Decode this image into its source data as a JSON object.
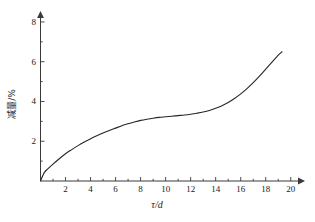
{
  "chart_data": {
    "type": "line",
    "title": "",
    "subtitle": "",
    "xlabel": "τ/d",
    "ylabel": "减量/%",
    "xlim": [
      0,
      21
    ],
    "ylim": [
      0,
      8.4
    ],
    "x_ticks": [
      2,
      4,
      6,
      8,
      10,
      12,
      14,
      16,
      18,
      20
    ],
    "x_tick_labels": [
      "2",
      "4",
      "6",
      "8",
      "10",
      "12",
      "14",
      "16",
      "18",
      "20"
    ],
    "x_minor_ticks": [
      1,
      3,
      5,
      7,
      9,
      11,
      13,
      15,
      17,
      19
    ],
    "y_ticks": [
      2,
      4,
      6,
      8
    ],
    "y_tick_labels": [
      "2",
      "4",
      "6",
      "8"
    ],
    "y_minor_ticks": [
      1,
      3,
      5,
      7
    ],
    "grid": false,
    "legend": null,
    "legend_position": "none",
    "axis_arrows": true,
    "series": [
      {
        "name": "减量",
        "color": "#262626",
        "line_width": 1.1,
        "x": [
          0.0,
          0.3,
          0.6,
          1.0,
          1.5,
          2.0,
          2.5,
          3.0,
          3.5,
          4.0,
          4.5,
          5.0,
          5.5,
          6.0,
          6.5,
          7.0,
          7.5,
          8.0,
          8.5,
          9.0,
          9.5,
          10.0,
          10.5,
          11.0,
          11.5,
          12.0,
          12.5,
          13.0,
          13.5,
          14.0,
          14.5,
          15.0,
          15.5,
          16.0,
          16.5,
          17.0,
          17.5,
          18.0,
          18.5,
          19.0,
          19.3
        ],
        "y": [
          0.0,
          0.42,
          0.62,
          0.85,
          1.12,
          1.37,
          1.58,
          1.78,
          1.96,
          2.12,
          2.27,
          2.41,
          2.54,
          2.66,
          2.78,
          2.88,
          2.97,
          3.05,
          3.11,
          3.16,
          3.2,
          3.23,
          3.26,
          3.29,
          3.32,
          3.36,
          3.41,
          3.47,
          3.55,
          3.66,
          3.79,
          3.95,
          4.15,
          4.38,
          4.65,
          4.95,
          5.28,
          5.63,
          5.98,
          6.33,
          6.5
        ]
      }
    ],
    "x_axis_pixel_origin": 40.5,
    "y_axis_pixel_origin": 181
  },
  "figure": {
    "background_color": "#ffffff",
    "axis_color": "#3a3a3a",
    "curve_color": "#262626"
  }
}
